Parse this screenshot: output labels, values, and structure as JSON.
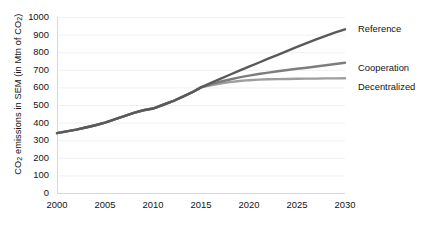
{
  "chart_data": {
    "type": "line",
    "title": "",
    "xlabel": "",
    "ylabel_html": "CO2 emissions in SEM (in Mtn of CO2)",
    "ylabel_main": "CO",
    "ylabel_sub1": "2",
    "ylabel_mid": " emissions in SEM (in Mtn of CO",
    "ylabel_sub2": "2",
    "ylabel_end": ")",
    "x": [
      2000,
      2001,
      2002,
      2003,
      2004,
      2005,
      2006,
      2007,
      2008,
      2009,
      2010,
      2011,
      2012,
      2013,
      2014,
      2015,
      2016,
      2017,
      2018,
      2019,
      2020,
      2021,
      2022,
      2023,
      2024,
      2025,
      2026,
      2027,
      2028,
      2029,
      2030
    ],
    "xlim": [
      2000,
      2030
    ],
    "ylim": [
      0,
      1000
    ],
    "xticks": [
      2000,
      2005,
      2010,
      2015,
      2020,
      2025,
      2030
    ],
    "xtick_labels": [
      "2000",
      "2005",
      "2010",
      "2015",
      "2020",
      "2025",
      "2030"
    ],
    "yticks": [
      0,
      100,
      200,
      300,
      400,
      500,
      600,
      700,
      800,
      900,
      1000
    ],
    "ytick_labels": [
      "0",
      "100",
      "200",
      "300",
      "400",
      "500",
      "600",
      "700",
      "800",
      "900",
      "1000"
    ],
    "grid": "horizontal-faint",
    "legend_position": "right-inline-labels",
    "series": [
      {
        "name": "Reference",
        "color": "#595959",
        "label": "Reference",
        "label_x": 358,
        "label_y": 24,
        "values": [
          340,
          350,
          360,
          372,
          385,
          400,
          418,
          437,
          455,
          470,
          480,
          500,
          520,
          545,
          570,
          600,
          625,
          648,
          672,
          695,
          718,
          740,
          763,
          785,
          808,
          830,
          852,
          873,
          893,
          913,
          930
        ]
      },
      {
        "name": "Cooperation",
        "color": "#7d7d7d",
        "label": "Cooperation",
        "label_x": 358,
        "label_y": 63,
        "values": [
          340,
          350,
          360,
          372,
          385,
          400,
          418,
          437,
          455,
          470,
          480,
          500,
          520,
          545,
          570,
          600,
          617,
          632,
          645,
          657,
          667,
          676,
          684,
          692,
          699,
          706,
          712,
          719,
          726,
          733,
          740
        ]
      },
      {
        "name": "Decentralized",
        "color": "#9e9e9e",
        "label": "Decentralized",
        "label_x": 358,
        "label_y": 82,
        "values": [
          340,
          350,
          360,
          372,
          385,
          400,
          418,
          437,
          455,
          470,
          480,
          500,
          520,
          545,
          570,
          600,
          612,
          622,
          630,
          636,
          641,
          644,
          646,
          647,
          648,
          649,
          650,
          650,
          651,
          651,
          652
        ]
      }
    ],
    "axis_color": "#d8d8d8",
    "grid_color": "#f0f0f0",
    "background": "#ffffff"
  },
  "geometry": {
    "plot_left": 57,
    "plot_right": 345,
    "plot_top": 17,
    "plot_bottom": 193
  }
}
